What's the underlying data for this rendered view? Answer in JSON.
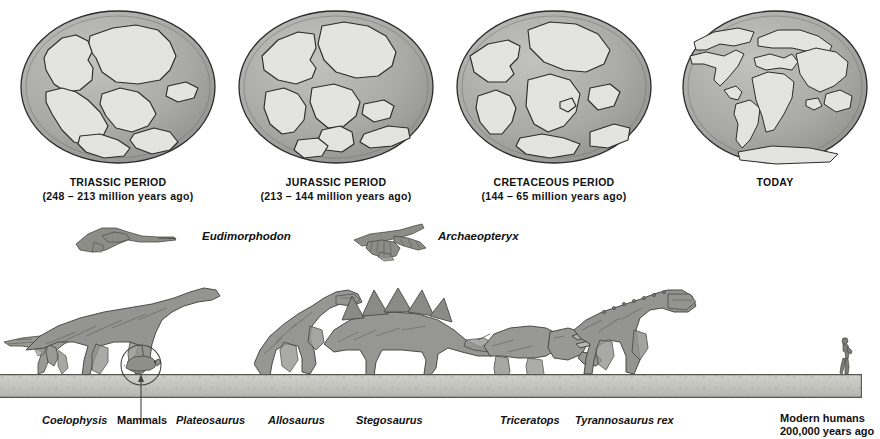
{
  "figure": {
    "background_color": "#ffffff",
    "ocean_color": "#a9a9a6",
    "land_color": "#e3e3df",
    "outline_color": "#2b2b2b",
    "ground_color": "#c6c6c0",
    "creature_color": "#8d8d88"
  },
  "globes": [
    {
      "id": "triassic",
      "icon": "globe-icon",
      "title": "TRIASSIC PERIOD",
      "subtitle": "(248 – 213 million years ago)",
      "description": "Pangaea single supercontinent"
    },
    {
      "id": "jurassic",
      "icon": "globe-icon",
      "title": "JURASSIC PERIOD",
      "subtitle": "(213 – 144 million years ago)",
      "description": "Pangaea rifting into Laurasia and Gondwana"
    },
    {
      "id": "cretaceous",
      "icon": "globe-icon",
      "title": "CRETACEOUS PERIOD",
      "subtitle": "(144 – 65 million years ago)",
      "description": "Continents widely separated, Atlantic opening"
    },
    {
      "id": "today",
      "icon": "globe-icon",
      "title": "TODAY",
      "subtitle": "",
      "description": "Modern continental configuration"
    }
  ],
  "flyers": [
    {
      "id": "eudimorphodon",
      "icon": "pterosaur-icon",
      "name": "Eudimorphodon"
    },
    {
      "id": "archaeopteryx",
      "icon": "archaeopteryx-icon",
      "name": "Archaeopteryx"
    }
  ],
  "creatures": [
    {
      "id": "coelophysis",
      "icon": "coelophysis-icon",
      "label": "Coelophysis",
      "style": "genus"
    },
    {
      "id": "mammals",
      "icon": "mammal-icon",
      "label": "Mammals",
      "style": "plain"
    },
    {
      "id": "plateosaurus",
      "icon": "plateosaurus-icon",
      "label": "Plateosaurus",
      "style": "genus"
    },
    {
      "id": "allosaurus",
      "icon": "allosaurus-icon",
      "label": "Allosaurus",
      "style": "genus"
    },
    {
      "id": "stegosaurus",
      "icon": "stegosaurus-icon",
      "label": "Stegosaurus",
      "style": "genus"
    },
    {
      "id": "triceratops",
      "icon": "triceratops-icon",
      "label": "Triceratops",
      "style": "genus"
    },
    {
      "id": "tyrannosaurus",
      "icon": "tyrannosaurus-icon",
      "label": "Tyrannosaurus rex",
      "style": "genus"
    }
  ],
  "human": {
    "icon": "human-figure-icon",
    "line1": "Modern humans",
    "line2": "200,000 years ago"
  },
  "callout": {
    "icon": "circle-callout-icon",
    "target": "mammals"
  }
}
